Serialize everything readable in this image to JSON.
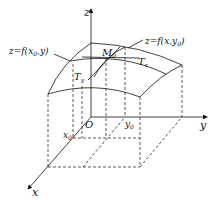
{
  "diagram": {
    "type": "3d-surface-partial-derivative",
    "axes": {
      "x": "x",
      "y": "y",
      "z": "z",
      "origin": "O"
    },
    "ticks": {
      "x0": "x",
      "x0_sub": "0",
      "y0": "y",
      "y0_sub": "0"
    },
    "point": {
      "label": "M",
      "sub": "0"
    },
    "tangents": {
      "tx": {
        "label": "T",
        "sub": "x"
      },
      "ty": {
        "label": "T",
        "sub": "y"
      }
    },
    "curves": {
      "left": {
        "prefix": "z=f(x",
        "sub": "0",
        "suffix": ",y)"
      },
      "right": {
        "prefix": "z=f(x,y",
        "sub": "0",
        "suffix": ")"
      }
    },
    "colors": {
      "ink": "#111111",
      "background": "#ffffff"
    }
  }
}
